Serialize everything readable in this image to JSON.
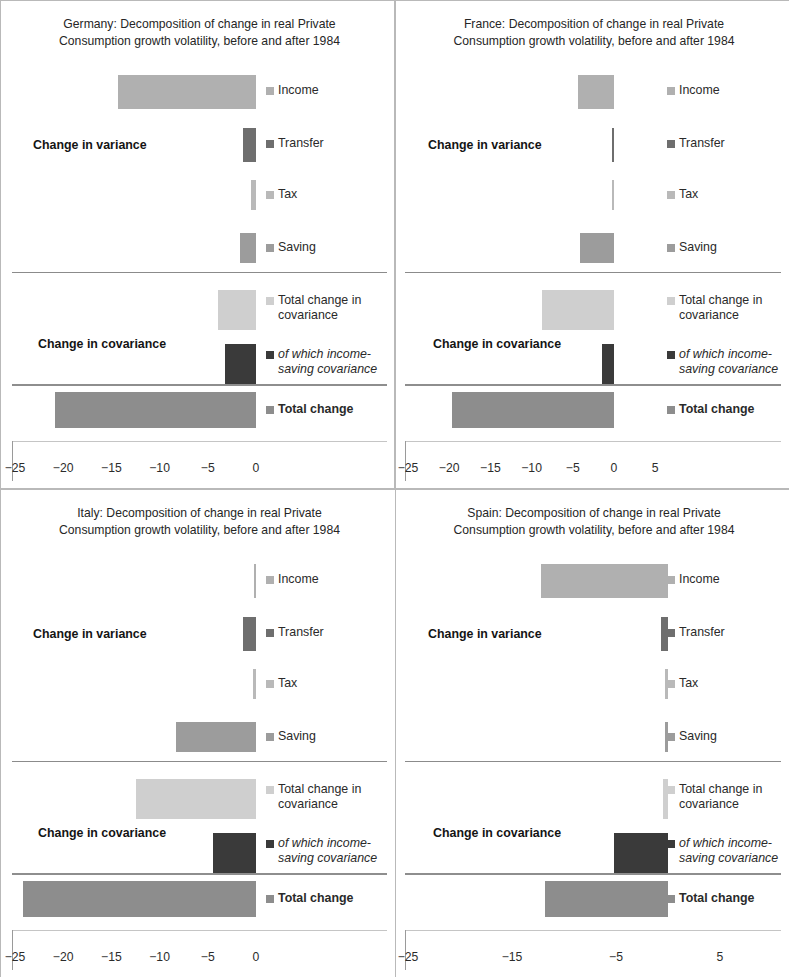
{
  "figure": {
    "panel_count": 4,
    "series_legend": [
      {
        "key": "income",
        "label": "Income",
        "color": "#b0b0b0"
      },
      {
        "key": "transfer",
        "label": "Transfer",
        "color": "#6e6e6e"
      },
      {
        "key": "tax",
        "label": "Tax",
        "color": "#b9b9b9"
      },
      {
        "key": "saving",
        "label": "Saving",
        "color": "#9c9c9c"
      },
      {
        "key": "total_covariance",
        "label": "Total change in\ncovariance",
        "color": "#cfcfcf"
      },
      {
        "key": "income_saving_covariance",
        "label": "of which income-\nsaving covariance",
        "color": "#3a3a3a"
      },
      {
        "key": "total_change",
        "label": "Total change",
        "color": "#8d8d8d"
      }
    ],
    "group_labels": {
      "variance": "Change in variance",
      "covariance": "Change in covariance"
    }
  },
  "chart_data": [
    {
      "type": "bar",
      "orientation": "horizontal",
      "panel": "germany",
      "title": "Germany: Decomposition of change in real Private\nConsumption growth volatility, before and after 1984",
      "xlabel": "",
      "ylabel": "",
      "xlim": [
        -26.5,
        1.2
      ],
      "ticks": [
        -25,
        -20,
        -15,
        -10,
        -5,
        0
      ],
      "tick_labels": [
        "−25",
        "−20",
        "−15",
        "−10",
        "−5",
        "0"
      ],
      "grid": false,
      "categories": [
        "Income",
        "Transfer",
        "Tax",
        "Saving",
        "Total change in covariance",
        "of which income-saving covariance",
        "Total change"
      ],
      "values": [
        -14.3,
        -1.3,
        -0.5,
        -1.7,
        -3.9,
        -3.2,
        -20.8
      ]
    },
    {
      "type": "bar",
      "orientation": "horizontal",
      "panel": "france",
      "title": "France: Decomposition of change in real Private\nConsumption growth volatility, before and after 1984",
      "xlabel": "",
      "ylabel": "",
      "xlim": [
        -26.0,
        6.5
      ],
      "ticks": [
        -25,
        -20,
        -15,
        -10,
        -5,
        0,
        5
      ],
      "tick_labels": [
        "−25",
        "−20",
        "−15",
        "−10",
        "−5",
        "0",
        "5"
      ],
      "grid": false,
      "categories": [
        "Income",
        "Transfer",
        "Tax",
        "Saving",
        "Total change in covariance",
        "of which income-saving covariance",
        "Total change"
      ],
      "values": [
        -4.4,
        -0.2,
        -0.3,
        -4.1,
        -8.7,
        -1.5,
        -19.6
      ]
    },
    {
      "type": "bar",
      "orientation": "horizontal",
      "panel": "italy",
      "title": "Italy: Decomposition of change in real Private\nConsumption growth volatility, before and after 1984",
      "xlabel": "",
      "ylabel": "",
      "xlim": [
        -26.5,
        1.2
      ],
      "ticks": [
        -25,
        -20,
        -15,
        -10,
        -5,
        0
      ],
      "tick_labels": [
        "−25",
        "−20",
        "−15",
        "−10",
        "−5",
        "0"
      ],
      "grid": false,
      "categories": [
        "Income",
        "Transfer",
        "Tax",
        "Saving",
        "Total change in covariance",
        "of which income-saving covariance",
        "Total change"
      ],
      "values": [
        -0.2,
        -1.3,
        -0.3,
        -8.3,
        -12.5,
        -4.5,
        -24.2
      ]
    },
    {
      "type": "bar",
      "orientation": "horizontal",
      "panel": "spain",
      "title": "Spain: Decomposition of change in real Private\nConsumption growth volatility, before and after 1984",
      "xlabel": "",
      "ylabel": "",
      "xlim": [
        -26.0,
        7.5
      ],
      "ticks": [
        -25,
        -15,
        -5,
        5
      ],
      "tick_labels": [
        "−25",
        "−15",
        "−5",
        "5"
      ],
      "grid": false,
      "categories": [
        "Income",
        "Transfer",
        "Tax",
        "Saving",
        "Total change in covariance",
        "of which income-saving covariance",
        "Total change"
      ],
      "values": [
        -12.2,
        -0.7,
        -0.3,
        -0.3,
        -0.5,
        -5.2,
        -11.8
      ]
    }
  ],
  "panels": {
    "germany": {
      "title": "Germany: Decomposition of change in real Private\nConsumption growth volatility, before and after 1984",
      "variance_label": "Change in variance",
      "covariance_label": "Change in covariance",
      "legend": {
        "income": "Income",
        "transfer": "Transfer",
        "tax": "Tax",
        "saving": "Saving",
        "total_covariance": "Total change in\ncovariance",
        "income_saving": "of which income-\nsaving covariance",
        "total_change": "Total change"
      },
      "ticks": [
        "−25",
        "−20",
        "−15",
        "−10",
        "−5",
        "0"
      ]
    },
    "france": {
      "title": "France: Decomposition of change in real Private\nConsumption growth volatility, before and after 1984",
      "variance_label": "Change in variance",
      "covariance_label": "Change in covariance",
      "legend": {
        "income": "Income",
        "transfer": "Transfer",
        "tax": "Tax",
        "saving": "Saving",
        "total_covariance": "Total change in\ncovariance",
        "income_saving": "of which income-\nsaving covariance",
        "total_change": "Total change"
      },
      "ticks": [
        "−25",
        "−20",
        "−15",
        "−10",
        "−5",
        "0",
        "5"
      ]
    },
    "italy": {
      "title": "Italy: Decomposition of change in real Private\nConsumption growth volatility, before and after 1984",
      "variance_label": "Change in variance",
      "covariance_label": "Change in covariance",
      "legend": {
        "income": "Income",
        "transfer": "Transfer",
        "tax": "Tax",
        "saving": "Saving",
        "total_covariance": "Total change in\ncovariance",
        "income_saving": "of which income-\nsaving covariance",
        "total_change": "Total change"
      },
      "ticks": [
        "−25",
        "−20",
        "−15",
        "−10",
        "−5",
        "0"
      ]
    },
    "spain": {
      "title": "Spain: Decomposition of change in real Private\nConsumption growth volatility, before and after 1984",
      "variance_label": "Change in variance",
      "covariance_label": "Change in covariance",
      "legend": {
        "income": "Income",
        "transfer": "Transfer",
        "tax": "Tax",
        "saving": "Saving",
        "total_covariance": "Total change in\ncovariance",
        "income_saving": "of which income-\nsaving covariance",
        "total_change": "Total change"
      },
      "ticks": [
        "−25",
        "−15",
        "−5",
        "5"
      ]
    }
  }
}
